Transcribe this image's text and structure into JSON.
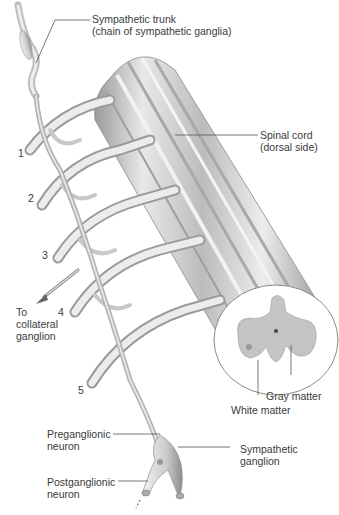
{
  "figure": {
    "labels": {
      "sympathetic_trunk_line1": "Sympathetic trunk",
      "sympathetic_trunk_line2": "(chain of sympathetic ganglia)",
      "spinal_cord_line1": "Spinal cord",
      "spinal_cord_line2": "(dorsal side)",
      "gray_matter": "Gray matter",
      "white_matter": "White matter",
      "to_collateral_line1": "To",
      "to_collateral_line2": "collateral",
      "to_collateral_line3": "ganglion",
      "preganglionic_line1": "Preganglionic",
      "preganglionic_line2": "neuron",
      "postganglionic_line1": "Postganglionic",
      "postganglionic_line2": "neuron",
      "sympathetic_ganglion_line1": "Sympathetic",
      "sympathetic_ganglion_line2": "ganglion"
    },
    "nerve_numbers": [
      "1",
      "2",
      "3",
      "4",
      "5"
    ],
    "colors": {
      "cord_light": "#e6e6e6",
      "cord_mid": "#bdbdbd",
      "cord_dark": "#8f8f8f",
      "gray_matter": "#c4c4c4",
      "white_matter": "#ffffff",
      "leader_line": "#555555"
    }
  }
}
